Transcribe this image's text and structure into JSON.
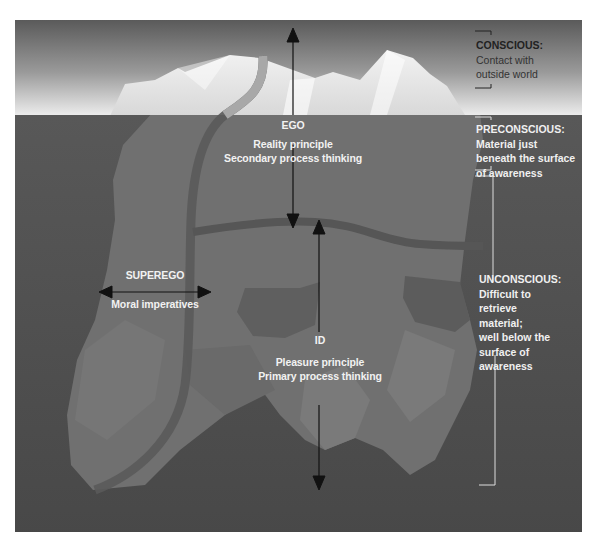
{
  "diagram": {
    "colors": {
      "sky_top": "#5e5e5e",
      "sky_bottom": "#e6e6e6",
      "water": "#4e4e4e",
      "water_deep": "#474747",
      "ice_above": "#e4e4e4",
      "ice_below": "#6f6f6f",
      "band": "#555555",
      "arrow": "#111111",
      "label_light": "#f2f2f2",
      "label_dark": "#222222"
    },
    "structures": {
      "ego": {
        "name": "EGO",
        "line1": "Reality principle",
        "line2": "Secondary process thinking"
      },
      "superego": {
        "name": "SUPEREGO",
        "line1": "Moral imperatives"
      },
      "id": {
        "name": "ID",
        "line1": "Pleasure principle",
        "line2": "Primary process thinking"
      }
    },
    "levels": [
      {
        "heading": "CONSCIOUS:",
        "lines": [
          "Contact with",
          "outside world"
        ]
      },
      {
        "heading": "PRECONSCIOUS:",
        "lines": [
          "Material just",
          "beneath the surface",
          "of awareness"
        ]
      },
      {
        "heading": "UNCONSCIOUS:",
        "lines": [
          "Difficult to",
          "retrieve",
          "material;",
          "well below the",
          "surface of",
          "awareness"
        ]
      }
    ]
  }
}
